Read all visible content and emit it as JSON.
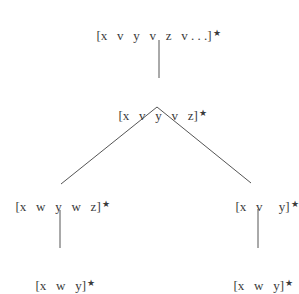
{
  "diagram": {
    "type": "tree",
    "edge_color": "#555555",
    "nodes": {
      "root": {
        "label": "[x   v   y   v   z   v . . .]",
        "marker": "★"
      },
      "level1": {
        "label": "[x   v   y   v   z]",
        "marker": "★"
      },
      "left": {
        "label": "[x   w   y   w   z]",
        "marker": "★"
      },
      "right": {
        "label": "[x   v     y]",
        "marker": "★"
      },
      "left_child": {
        "label": "[x   w   y]",
        "marker": "★"
      },
      "right_child": {
        "label": "[x   w   y]",
        "marker": "★"
      }
    },
    "edges": [
      {
        "from": "root",
        "to": "level1"
      },
      {
        "from": "level1",
        "to": "left"
      },
      {
        "from": "level1",
        "to": "right"
      },
      {
        "from": "left",
        "to": "left_child"
      },
      {
        "from": "right",
        "to": "right_child"
      }
    ]
  }
}
